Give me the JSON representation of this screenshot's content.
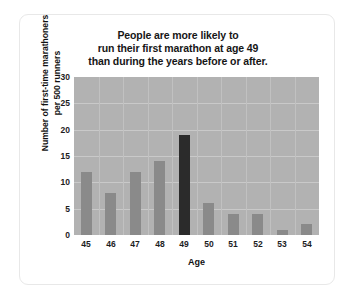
{
  "chart_data": {
    "type": "bar",
    "title": "People are more likely to run their first marathon at age 49 than during the years before or after.",
    "title_lines": [
      "People are more likely to",
      "run their first marathon at age 49",
      "than during the years before or after."
    ],
    "xlabel": "Age",
    "ylabel": "Number of first-time marathoners per 500 runners",
    "ylabel_lines": [
      "Number of first-time marathoners",
      "per 500 runners"
    ],
    "categories": [
      "45",
      "46",
      "47",
      "48",
      "49",
      "50",
      "51",
      "52",
      "53",
      "54"
    ],
    "values": [
      12,
      8,
      12,
      14,
      19,
      6,
      4,
      4,
      1,
      2
    ],
    "ylim": [
      0,
      30
    ],
    "yticks": [
      "0",
      "5",
      "10",
      "15",
      "20",
      "25",
      "30"
    ],
    "ytick_values": [
      0,
      5,
      10,
      15,
      20,
      25,
      30
    ],
    "highlight_category": "49",
    "grid": true,
    "legend": "none",
    "colors": {
      "bar": "#8a8a8a",
      "bar_highlight": "#2b2b2b",
      "plot_background": "#b2b2b2",
      "gridline": "#c9c9c9",
      "figure_background": "#ffffff",
      "text": "#1d1d1d"
    }
  }
}
